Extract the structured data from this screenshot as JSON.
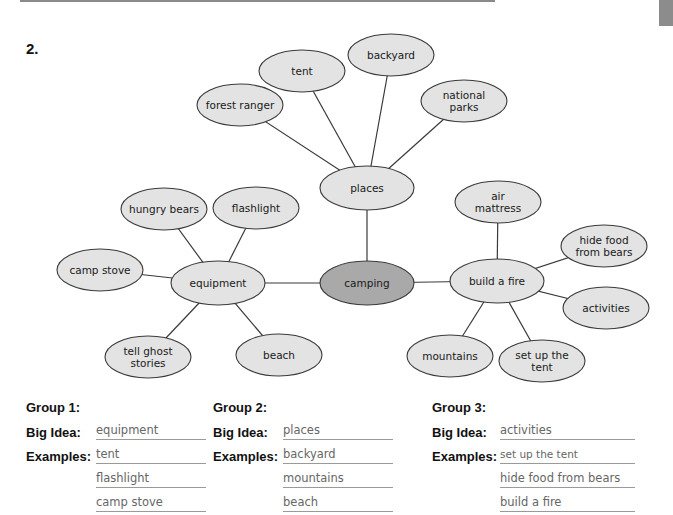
{
  "problem_number": "2.",
  "web": {
    "center": {
      "label": "camping",
      "cx": 367,
      "cy": 283,
      "rx": 47,
      "ry": 22,
      "fill": "#a9a9a9"
    },
    "hubs": [
      {
        "id": "places",
        "label": "places",
        "cx": 367,
        "cy": 188,
        "rx": 47,
        "ry": 22
      },
      {
        "id": "equipment",
        "label": "equipment",
        "cx": 218,
        "cy": 283,
        "rx": 47,
        "ry": 22
      },
      {
        "id": "build-a-fire",
        "label": "build a fire",
        "cx": 497,
        "cy": 281,
        "rx": 47,
        "ry": 22
      }
    ],
    "leaves": [
      {
        "hub": "places",
        "lines": [
          "tent"
        ],
        "cx": 302,
        "cy": 71
      },
      {
        "hub": "places",
        "lines": [
          "backyard"
        ],
        "cx": 391,
        "cy": 55
      },
      {
        "hub": "places",
        "lines": [
          "forest ranger"
        ],
        "cx": 240,
        "cy": 105
      },
      {
        "hub": "places",
        "lines": [
          "national",
          "parks"
        ],
        "cx": 464,
        "cy": 101
      },
      {
        "hub": "equipment",
        "lines": [
          "hungry bears"
        ],
        "cx": 164,
        "cy": 209
      },
      {
        "hub": "equipment",
        "lines": [
          "flashlight"
        ],
        "cx": 256,
        "cy": 208
      },
      {
        "hub": "equipment",
        "lines": [
          "camp stove"
        ],
        "cx": 100,
        "cy": 270
      },
      {
        "hub": "equipment",
        "lines": [
          "tell ghost",
          "stories"
        ],
        "cx": 148,
        "cy": 357
      },
      {
        "hub": "equipment",
        "lines": [
          "beach"
        ],
        "cx": 279,
        "cy": 355
      },
      {
        "hub": "build-a-fire",
        "lines": [
          "air",
          "mattress"
        ],
        "cx": 498,
        "cy": 202
      },
      {
        "hub": "build-a-fire",
        "lines": [
          "hide food",
          "from bears"
        ],
        "cx": 604,
        "cy": 246
      },
      {
        "hub": "build-a-fire",
        "lines": [
          "activities"
        ],
        "cx": 606,
        "cy": 308
      },
      {
        "hub": "build-a-fire",
        "lines": [
          "mountains"
        ],
        "cx": 450,
        "cy": 356
      },
      {
        "hub": "build-a-fire",
        "lines": [
          "set up the",
          "tent"
        ],
        "cx": 542,
        "cy": 361
      }
    ],
    "colors": {
      "node_fill": "#e3e3e3",
      "center_fill": "#a9a9a9",
      "stroke": "#3a3a3a"
    }
  },
  "groups": [
    {
      "title": "Group 1:",
      "big_idea_label": "Big Idea:",
      "examples_label": "Examples:",
      "big_idea": "equipment",
      "examples": [
        "tent",
        "flashlight",
        "camp stove"
      ]
    },
    {
      "title": "Group 2:",
      "big_idea_label": "Big Idea:",
      "examples_label": "Examples:",
      "big_idea": "places",
      "examples": [
        "backyard",
        "mountains",
        "beach"
      ]
    },
    {
      "title": "Group 3:",
      "big_idea_label": "Big Idea:",
      "examples_label": "Examples:",
      "big_idea": "activities",
      "examples": [
        "set up the tent",
        "hide food from bears",
        "build a fire"
      ]
    }
  ]
}
